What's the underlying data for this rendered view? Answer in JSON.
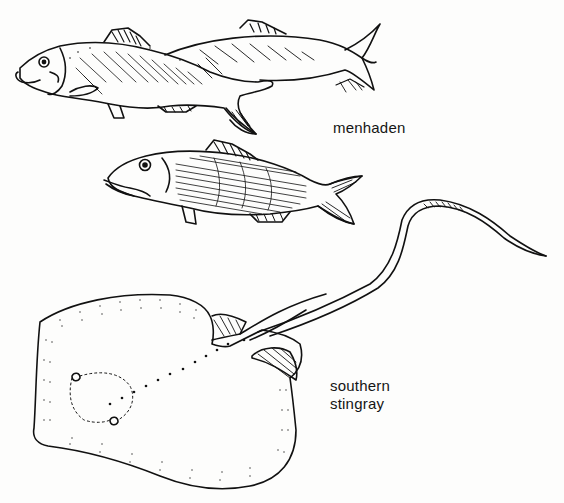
{
  "figure": {
    "labels": {
      "menhaden": "menhaden",
      "stingray_line1": "southern",
      "stingray_line2": "stingray"
    },
    "subjects": [
      {
        "name": "menhaden",
        "count_drawn": 2
      },
      {
        "name": "southern stingray",
        "count_drawn": 1
      }
    ],
    "colors": {
      "ink": "#111111",
      "paper": "#fdfdfc"
    }
  }
}
